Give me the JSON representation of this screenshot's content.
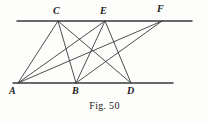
{
  "figure": {
    "caption": "Fig. 50",
    "stroke_color": "#3a3a3a",
    "label_color": "#1a1a1a",
    "background_color": "#fdfdfc",
    "width": 209,
    "height": 122
  },
  "chart_data": {
    "type": "diagram",
    "title": "Fig. 50",
    "points": [
      {
        "label": "C",
        "x": 58,
        "y": 21,
        "line": "upper",
        "label_x": 53,
        "label_y": 6
      },
      {
        "label": "E",
        "x": 105,
        "y": 21,
        "line": "upper",
        "label_x": 100,
        "label_y": 6
      },
      {
        "label": "F",
        "x": 162,
        "y": 21,
        "line": "upper",
        "label_x": 157,
        "label_y": 4
      },
      {
        "label": "A",
        "x": 18,
        "y": 83,
        "line": "lower",
        "label_x": 9,
        "label_y": 86
      },
      {
        "label": "B",
        "x": 76,
        "y": 83,
        "line": "lower",
        "label_x": 72,
        "label_y": 86
      },
      {
        "label": "D",
        "x": 131,
        "y": 83,
        "line": "lower",
        "label_x": 127,
        "label_y": 86
      }
    ],
    "parallel_lines": [
      {
        "name": "upper-parallel-line",
        "x1": 17,
        "y1": 21,
        "x2": 192,
        "y2": 21
      },
      {
        "name": "lower-parallel-line",
        "x1": 13,
        "y1": 83,
        "x2": 173,
        "y2": 83
      }
    ],
    "segments": [
      {
        "name": "segment-A-C",
        "from": "A",
        "to": "C",
        "x1": 18,
        "y1": 83,
        "x2": 58,
        "y2": 21
      },
      {
        "name": "segment-A-E",
        "from": "A",
        "to": "E",
        "x1": 18,
        "y1": 83,
        "x2": 105,
        "y2": 21
      },
      {
        "name": "segment-A-F",
        "from": "A",
        "to": "F",
        "x1": 18,
        "y1": 83,
        "x2": 162,
        "y2": 21
      },
      {
        "name": "segment-C-B",
        "from": "C",
        "to": "B",
        "x1": 58,
        "y1": 21,
        "x2": 76,
        "y2": 83
      },
      {
        "name": "segment-C-D",
        "from": "C",
        "to": "D",
        "x1": 58,
        "y1": 21,
        "x2": 131,
        "y2": 83
      },
      {
        "name": "segment-E-B",
        "from": "E",
        "to": "B",
        "x1": 105,
        "y1": 21,
        "x2": 76,
        "y2": 83
      },
      {
        "name": "segment-E-D",
        "from": "E",
        "to": "D",
        "x1": 105,
        "y1": 21,
        "x2": 131,
        "y2": 83
      },
      {
        "name": "segment-F-B",
        "from": "F",
        "to": "B",
        "x1": 162,
        "y1": 21,
        "x2": 76,
        "y2": 83
      }
    ],
    "xlabel": "",
    "ylabel": "",
    "grid": false,
    "legend": "none"
  }
}
